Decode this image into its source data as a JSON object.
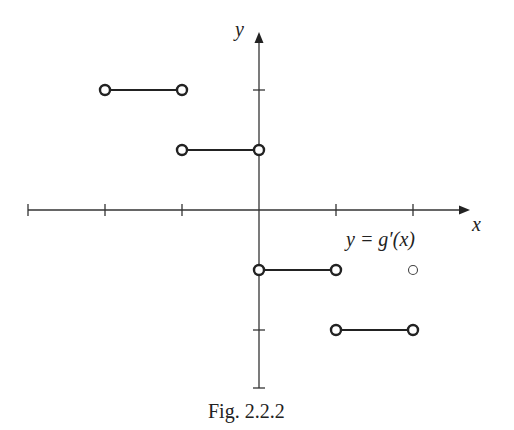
{
  "chart_data": {
    "type": "line",
    "title": "",
    "caption": "Fig.  2.2.2",
    "xlabel": "x",
    "ylabel": "y",
    "function_label": "y = g′(x)",
    "x_ticks": [
      -3,
      -2,
      -1,
      0,
      1,
      2
    ],
    "y_ticks": [
      1,
      -1
    ],
    "xlim": [
      -3,
      2.7
    ],
    "ylim": [
      -1.5,
      1.5
    ],
    "grid": false,
    "legend": null,
    "series": [
      {
        "name": "g'(x)",
        "style": "step, open endpoints",
        "segments": [
          {
            "x": [
              -2,
              -1
            ],
            "y": 1,
            "left_endpoint": "open",
            "right_endpoint": "open"
          },
          {
            "x": [
              -1,
              0
            ],
            "y": 0.5,
            "left_endpoint": "open",
            "right_endpoint": "open"
          },
          {
            "x": [
              0,
              1
            ],
            "y": -0.5,
            "left_endpoint": "open",
            "right_endpoint": "open"
          },
          {
            "x": [
              1,
              2
            ],
            "y": -1,
            "left_endpoint": "open",
            "right_endpoint": "open"
          }
        ]
      }
    ],
    "annotations": [
      {
        "type": "small-open-circle",
        "x": 2,
        "y": -0.5
      }
    ]
  },
  "labels": {
    "x_axis": "x",
    "y_axis": "y",
    "function": "y = g′(x)",
    "caption": "Fig.  2.2.2"
  },
  "colors": {
    "ink": "#222222",
    "background": "#ffffff"
  }
}
